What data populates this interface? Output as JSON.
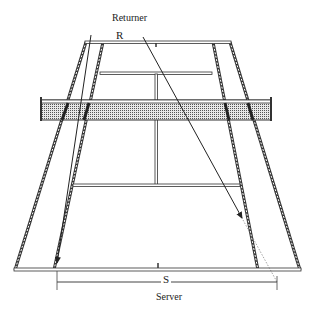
{
  "figure": {
    "type": "tennis-court-perspective",
    "labels": {
      "returner": "Returner",
      "returner_marker": "R",
      "server": "Server",
      "server_marker": "S"
    },
    "colors": {
      "line": "#333333",
      "net_fill": "#b8b8b8",
      "background": "#ffffff"
    },
    "court": {
      "far_baseline": {
        "y": 42,
        "x1": 86,
        "x2": 230
      },
      "far_service_line": {
        "y": 73,
        "x1": 100,
        "x2": 212
      },
      "net": {
        "top": 98,
        "bottom": 120,
        "x1": 40,
        "x2": 272
      },
      "near_service_line": {
        "y": 185,
        "x1": 73,
        "x2": 240
      },
      "near_baseline": {
        "y": 270,
        "x1": 15,
        "x2": 300
      }
    },
    "arrows": [
      {
        "name": "wide-return-left",
        "from": [
          91,
          35
        ],
        "to": [
          57,
          263
        ]
      },
      {
        "name": "return-to-right",
        "from": [
          143,
          37
        ],
        "to": [
          242,
          218
        ],
        "dotted_extension_to": [
          277,
          282
        ]
      }
    ],
    "dimension": {
      "label": "S",
      "y": 282,
      "x1": 57,
      "x2": 277
    }
  }
}
